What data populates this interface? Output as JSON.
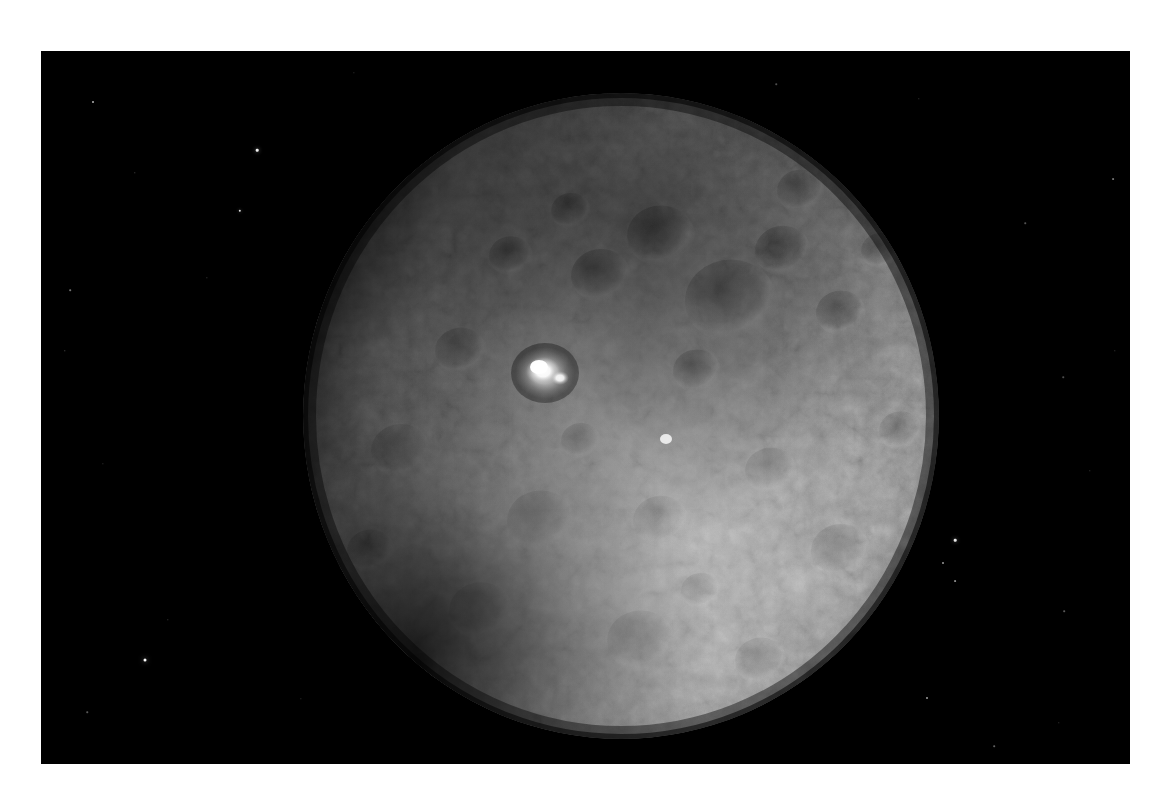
{
  "image": {
    "subject_name": "Ceres",
    "subject_type": "dwarf planet",
    "view_description": "Sunlit disk of Ceres against black space, heavily cratered northern terrain in shadow-toned gray and a brighter smoother southern hemisphere",
    "notable_feature": "Occator Crater bright spots",
    "background_color": "#000000",
    "border_color": "#ffffff",
    "surface_light_tone": "#c9c9c9",
    "surface_mid_tone": "#8e8e8e",
    "surface_dark_tone": "#3a3a3a",
    "bright_spot_color": "#ffffff",
    "star_color": "#ffffff",
    "plate": {
      "left": 41,
      "top": 51,
      "width": 1089,
      "height": 713
    },
    "disk": {
      "center_x": 580,
      "center_y": 365,
      "radius_x": 318,
      "radius_y": 323
    },
    "occator": {
      "x": 504,
      "y": 322,
      "radius": 17
    },
    "caption": ""
  },
  "stars": [
    {
      "x": 52,
      "y": 51,
      "size": 2.0,
      "opacity": 0.7
    },
    {
      "x": 216,
      "y": 99,
      "size": 2.6,
      "opacity": 0.95
    },
    {
      "x": 199,
      "y": 160,
      "size": 2.4,
      "opacity": 0.88
    },
    {
      "x": 29,
      "y": 239,
      "size": 1.6,
      "opacity": 0.45
    },
    {
      "x": 94,
      "y": 122,
      "size": 1.4,
      "opacity": 0.35
    },
    {
      "x": 166,
      "y": 227,
      "size": 1.3,
      "opacity": 0.3
    },
    {
      "x": 24,
      "y": 300,
      "size": 1.4,
      "opacity": 0.4
    },
    {
      "x": 104,
      "y": 609,
      "size": 3.0,
      "opacity": 1.0
    },
    {
      "x": 46,
      "y": 661,
      "size": 1.5,
      "opacity": 0.35
    },
    {
      "x": 127,
      "y": 569,
      "size": 1.4,
      "opacity": 0.3
    },
    {
      "x": 914,
      "y": 489,
      "size": 2.6,
      "opacity": 0.92
    },
    {
      "x": 902,
      "y": 512,
      "size": 2.0,
      "opacity": 0.6
    },
    {
      "x": 914,
      "y": 530,
      "size": 1.8,
      "opacity": 0.55
    },
    {
      "x": 886,
      "y": 647,
      "size": 2.0,
      "opacity": 0.62
    },
    {
      "x": 1072,
      "y": 128,
      "size": 1.8,
      "opacity": 0.45
    },
    {
      "x": 1023,
      "y": 560,
      "size": 1.6,
      "opacity": 0.35
    },
    {
      "x": 1022,
      "y": 326,
      "size": 1.5,
      "opacity": 0.3
    },
    {
      "x": 1074,
      "y": 300,
      "size": 1.4,
      "opacity": 0.28
    },
    {
      "x": 984,
      "y": 172,
      "size": 1.5,
      "opacity": 0.32
    },
    {
      "x": 1049,
      "y": 420,
      "size": 1.4,
      "opacity": 0.28
    },
    {
      "x": 953,
      "y": 695,
      "size": 1.6,
      "opacity": 0.38
    },
    {
      "x": 690,
      "y": 660,
      "size": 1.4,
      "opacity": 0.26
    },
    {
      "x": 260,
      "y": 648,
      "size": 1.3,
      "opacity": 0.25
    },
    {
      "x": 1018,
      "y": 672,
      "size": 1.4,
      "opacity": 0.28
    },
    {
      "x": 735,
      "y": 33,
      "size": 1.5,
      "opacity": 0.3
    },
    {
      "x": 313,
      "y": 22,
      "size": 1.3,
      "opacity": 0.25
    },
    {
      "x": 62,
      "y": 413,
      "size": 1.3,
      "opacity": 0.25
    },
    {
      "x": 878,
      "y": 48,
      "size": 1.4,
      "opacity": 0.28
    }
  ],
  "craters": [
    {
      "x": 690,
      "y": 250,
      "r": 46,
      "tone": 0.36
    },
    {
      "x": 620,
      "y": 185,
      "r": 34,
      "tone": 0.3
    },
    {
      "x": 742,
      "y": 200,
      "r": 28,
      "tone": 0.34
    },
    {
      "x": 560,
      "y": 225,
      "r": 30,
      "tone": 0.28
    },
    {
      "x": 800,
      "y": 262,
      "r": 25,
      "tone": 0.4
    },
    {
      "x": 656,
      "y": 320,
      "r": 24,
      "tone": 0.32
    },
    {
      "x": 470,
      "y": 205,
      "r": 22,
      "tone": 0.35
    },
    {
      "x": 530,
      "y": 160,
      "r": 20,
      "tone": 0.38
    },
    {
      "x": 760,
      "y": 140,
      "r": 24,
      "tone": 0.42
    },
    {
      "x": 840,
      "y": 200,
      "r": 20,
      "tone": 0.45
    },
    {
      "x": 420,
      "y": 300,
      "r": 26,
      "tone": 0.46
    },
    {
      "x": 360,
      "y": 400,
      "r": 30,
      "tone": 0.5
    },
    {
      "x": 500,
      "y": 470,
      "r": 34,
      "tone": 0.55
    },
    {
      "x": 620,
      "y": 470,
      "r": 28,
      "tone": 0.58
    },
    {
      "x": 730,
      "y": 420,
      "r": 26,
      "tone": 0.56
    },
    {
      "x": 800,
      "y": 500,
      "r": 30,
      "tone": 0.6
    },
    {
      "x": 440,
      "y": 560,
      "r": 32,
      "tone": 0.58
    },
    {
      "x": 600,
      "y": 590,
      "r": 34,
      "tone": 0.56
    },
    {
      "x": 720,
      "y": 610,
      "r": 26,
      "tone": 0.58
    },
    {
      "x": 330,
      "y": 500,
      "r": 24,
      "tone": 0.48
    },
    {
      "x": 860,
      "y": 380,
      "r": 22,
      "tone": 0.6
    },
    {
      "x": 540,
      "y": 390,
      "r": 20,
      "tone": 0.5
    },
    {
      "x": 660,
      "y": 540,
      "r": 20,
      "tone": 0.58
    },
    {
      "x": 380,
      "y": 620,
      "r": 20,
      "tone": 0.5
    },
    {
      "x": 820,
      "y": 600,
      "r": 22,
      "tone": 0.58
    }
  ]
}
